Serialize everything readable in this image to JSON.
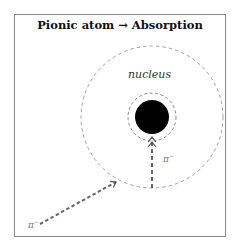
{
  "title": "Pionic atom → Absorption",
  "labels": {
    "nucleus": "nucleus",
    "pion_incoming": "π",
    "pion_incoming_charge": "−",
    "pion_inner": "π",
    "pion_inner_charge": "−"
  },
  "diagram": {
    "outer_orbit": {
      "cx": 152,
      "cy": 117,
      "r": 71,
      "style": "dashed",
      "color": "#888888"
    },
    "inner_orbit": {
      "cx": 152,
      "cy": 117,
      "r": 24,
      "style": "dashed",
      "color": "#666666"
    },
    "nucleus": {
      "cx": 152,
      "cy": 117,
      "r": 17,
      "color": "#000000"
    },
    "incoming_path": {
      "from": [
        40,
        224
      ],
      "to": [
        116,
        182
      ],
      "style": "dashed-arrow",
      "color": "#666666"
    },
    "capture_path": {
      "from": [
        152,
        188
      ],
      "to": [
        152,
        140
      ],
      "style": "dashed-arrow",
      "color": "#666666"
    }
  }
}
